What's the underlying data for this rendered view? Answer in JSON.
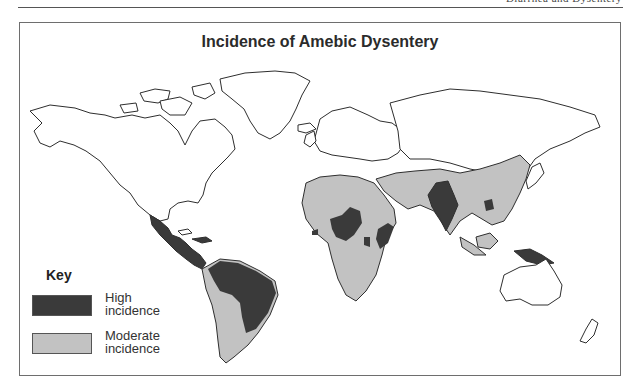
{
  "page": {
    "running_head": "Diarrhea and Dysentery"
  },
  "map": {
    "title": "Incidence of Amebic Dysentery",
    "colors": {
      "high": "#3a3a3a",
      "moderate": "#c2c2c2",
      "none": "#ffffff",
      "outline": "#2e2e2e"
    },
    "regions": {
      "high": [
        "Mexico",
        "Central America",
        "Northern & central South America (Brazil, Venezuela, Colombia)",
        "Central Africa",
        "West African coast",
        "East Africa (Somalia, Ethiopia)",
        "India",
        "Vietnam",
        "New Guinea"
      ],
      "moderate": [
        "Remainder of South America",
        "North Africa",
        "Southern Africa",
        "Middle East",
        "China",
        "Southeast Asia",
        "Indonesia"
      ]
    }
  },
  "key": {
    "title": "Key",
    "items": [
      {
        "label_line1": "High",
        "label_line2": "incidence",
        "color": "#3a3a3a"
      },
      {
        "label_line1": "Moderate",
        "label_line2": "incidence",
        "color": "#c2c2c2"
      }
    ]
  }
}
